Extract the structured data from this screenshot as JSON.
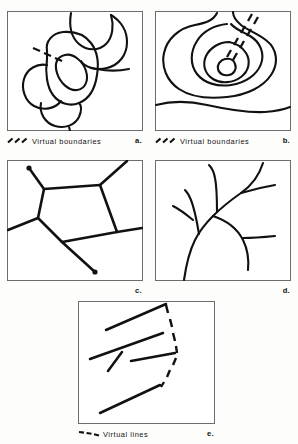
{
  "figure": {
    "background_color": "#fdfdfc",
    "ink_color": "#111111",
    "frame_color": "#6d6d6d"
  },
  "panels": [
    {
      "id": "a",
      "letter": "a.",
      "legend_label": "Virtual boundaries",
      "legend_symbol": "slanted-dash-triple",
      "subject": "cell-like closed blobs with central nucleus ellipse and dashed virtual boundary",
      "has_legend": true
    },
    {
      "id": "b",
      "letter": "b.",
      "legend_label": "Virtual boundaries",
      "legend_symbol": "slanted-dash-triple",
      "subject": "nested contour rings with small central blob and dashed virtual boundary to upper right",
      "has_legend": true
    },
    {
      "id": "c",
      "letter": "c.",
      "legend_label": "",
      "legend_symbol": "",
      "subject": "polygonal cell network with terminal node dots",
      "has_legend": false
    },
    {
      "id": "d",
      "letter": "d.",
      "legend_label": "",
      "legend_symbol": "",
      "subject": "dendritic branching tree structure",
      "has_legend": false
    },
    {
      "id": "e",
      "letter": "e.",
      "legend_label": "Virtual lines",
      "legend_symbol": "dash-triple",
      "subject": "converging straight line segments joined by a dashed virtual line",
      "has_legend": true
    }
  ]
}
